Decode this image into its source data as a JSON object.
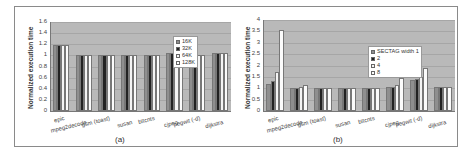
{
  "chart_data": [
    {
      "type": "bar",
      "title": "",
      "caption": "(a)",
      "xlabel": "",
      "ylabel": "Normalized execution time",
      "ylim": [
        0,
        1.6
      ],
      "yticks": [
        "0",
        "0.2",
        "0.4",
        "0.6",
        "0.8",
        "1",
        "1.2",
        "1.4",
        "1.6"
      ],
      "grid": true,
      "legend_position": "upper right inside",
      "categories": [
        "epic",
        "mpeg2decode",
        "gsm (toast)",
        "susan",
        "bitcnts",
        "cjpeg",
        "pegwit (-d)",
        "dijkstra"
      ],
      "series": [
        {
          "name": "16K",
          "values": [
            1.18,
            1.0,
            1.0,
            1.0,
            1.0,
            1.04,
            1.12,
            1.05
          ]
        },
        {
          "name": "32K",
          "values": [
            1.18,
            1.0,
            1.0,
            1.0,
            1.0,
            1.04,
            1.0,
            1.05
          ]
        },
        {
          "name": "64K",
          "values": [
            1.18,
            1.0,
            1.0,
            1.0,
            1.0,
            1.04,
            1.0,
            1.05
          ]
        },
        {
          "name": "128K",
          "values": [
            1.18,
            1.0,
            1.0,
            1.0,
            1.0,
            1.03,
            1.0,
            1.05
          ]
        }
      ]
    },
    {
      "type": "bar",
      "title": "",
      "caption": "(b)",
      "xlabel": "",
      "ylabel": "Normalized execution time",
      "ylim": [
        0,
        4
      ],
      "yticks": [
        "0",
        "0.5",
        "1",
        "1.5",
        "2",
        "2.5",
        "3",
        "3.5",
        "4"
      ],
      "grid": true,
      "legend_position": "center right inside",
      "categories": [
        "epic",
        "mpeg2decode",
        "gsm (toast)",
        "susan",
        "bitcnts",
        "cjpeg",
        "pegwit (-d)",
        "dijkstra"
      ],
      "series": [
        {
          "name": "SECTAG width 1",
          "values": [
            1.2,
            1.02,
            1.0,
            1.0,
            1.0,
            1.04,
            1.35,
            1.05
          ]
        },
        {
          "name": "2",
          "values": [
            1.3,
            1.02,
            1.0,
            1.0,
            1.0,
            1.07,
            1.4,
            1.05
          ]
        },
        {
          "name": "4",
          "values": [
            1.72,
            1.05,
            1.0,
            1.0,
            1.0,
            1.13,
            1.5,
            1.05
          ]
        },
        {
          "name": "8",
          "values": [
            3.55,
            1.15,
            1.0,
            1.0,
            1.0,
            1.45,
            1.87,
            1.05
          ]
        }
      ]
    }
  ],
  "colors": {
    "plot_background": "#b9b9b9",
    "series": [
      "#8f8f8f",
      "#222222",
      "#f4f4f4",
      "#fbfbfb"
    ]
  }
}
